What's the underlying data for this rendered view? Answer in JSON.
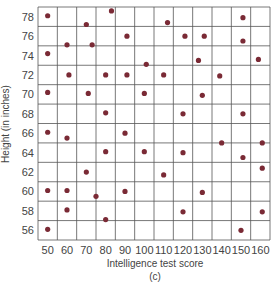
{
  "chart_data": {
    "type": "scatter",
    "title": "",
    "caption": "(c)",
    "xlabel": "Intelligence test score",
    "ylabel": "Height (in inches)",
    "xlim": [
      45,
      165
    ],
    "ylim": [
      55,
      79
    ],
    "x_ticks": [
      50,
      60,
      70,
      80,
      90,
      100,
      110,
      120,
      130,
      140,
      150,
      160
    ],
    "y_ticks": [
      56,
      58,
      60,
      62,
      64,
      66,
      68,
      70,
      72,
      74,
      76,
      78
    ],
    "grid": true,
    "legend": null,
    "point_color": "#7a2a35",
    "series": [
      {
        "name": "observations",
        "points": [
          [
            50,
            78.1
          ],
          [
            70,
            77.2
          ],
          [
            83,
            78.6
          ],
          [
            60,
            75.1
          ],
          [
            73,
            75.1
          ],
          [
            50,
            74.2
          ],
          [
            61,
            72.0
          ],
          [
            80,
            72.0
          ],
          [
            112,
            77.4
          ],
          [
            91,
            76.0
          ],
          [
            121,
            76.0
          ],
          [
            101,
            73.1
          ],
          [
            91,
            72.0
          ],
          [
            110,
            72.0
          ],
          [
            151,
            77.9
          ],
          [
            131,
            76.0
          ],
          [
            151,
            75.5
          ],
          [
            128,
            73.5
          ],
          [
            159,
            73.6
          ],
          [
            139,
            71.9
          ],
          [
            50,
            70.2
          ],
          [
            71,
            70.1
          ],
          [
            80,
            68.1
          ],
          [
            50,
            66.1
          ],
          [
            60,
            65.5
          ],
          [
            80,
            64.1
          ],
          [
            100,
            70.1
          ],
          [
            120,
            68.0
          ],
          [
            90,
            66.0
          ],
          [
            100,
            64.1
          ],
          [
            120,
            64.0
          ],
          [
            130,
            69.9
          ],
          [
            151,
            68.0
          ],
          [
            140,
            65.0
          ],
          [
            161,
            65.0
          ],
          [
            151,
            63.5
          ],
          [
            70,
            62.0
          ],
          [
            50,
            60.1
          ],
          [
            60,
            60.1
          ],
          [
            75,
            59.5
          ],
          [
            60,
            58.1
          ],
          [
            80,
            57.1
          ],
          [
            50,
            56.1
          ],
          [
            110,
            61.7
          ],
          [
            90,
            60.0
          ],
          [
            120,
            57.9
          ],
          [
            161,
            62.4
          ],
          [
            130,
            59.9
          ],
          [
            161,
            57.9
          ],
          [
            150,
            56.0
          ]
        ]
      }
    ]
  }
}
